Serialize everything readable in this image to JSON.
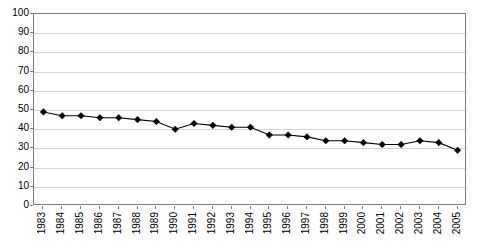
{
  "chart_data": {
    "type": "line",
    "title": "",
    "subtitle": "",
    "xlabel": "",
    "ylabel": "",
    "categories": [
      "1983",
      "1984",
      "1985",
      "1986",
      "1987",
      "1988",
      "1989",
      "1990",
      "1991",
      "1992",
      "1993",
      "1994",
      "1995",
      "1996",
      "1997",
      "1998",
      "1999",
      "2000",
      "2001",
      "2002",
      "2003",
      "2004",
      "2005"
    ],
    "values": [
      49,
      47,
      47,
      46,
      46,
      45,
      44,
      40,
      43,
      42,
      41,
      41,
      37,
      37,
      36,
      34,
      34,
      33,
      32,
      32,
      34,
      33,
      29
    ],
    "series": [
      {
        "name": "Series 1",
        "values": [
          49,
          47,
          47,
          46,
          46,
          45,
          44,
          40,
          43,
          42,
          41,
          41,
          37,
          37,
          36,
          34,
          34,
          33,
          32,
          32,
          34,
          33,
          29
        ]
      }
    ],
    "ylim": [
      0,
      100
    ],
    "ytick_step": 10,
    "yticks": [
      0,
      10,
      20,
      30,
      40,
      50,
      60,
      70,
      80,
      90,
      100
    ],
    "ytick_labels": [
      "0",
      "10",
      "20",
      "30",
      "40",
      "50",
      "60",
      "70",
      "80",
      "90",
      "100"
    ],
    "grid": true,
    "grid_axis": "y",
    "legend": false,
    "legend_position": "none",
    "marker": "diamond",
    "line_color": "#000000",
    "marker_color": "#000000",
    "gridline_color": "#d4d4d4",
    "axis_color": "#7b7b7b",
    "background_color": "#ffffff",
    "annotations": []
  }
}
